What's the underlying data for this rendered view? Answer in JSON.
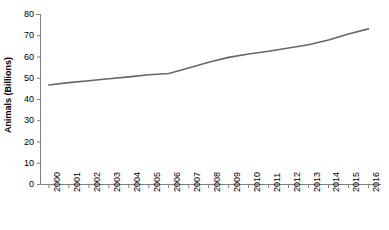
{
  "chart_data": {
    "type": "line",
    "title": "",
    "xlabel": "",
    "ylabel": "Animals (Billions)",
    "categories": [
      "2000",
      "2001",
      "2002",
      "2003",
      "2004",
      "2005",
      "2006",
      "2007",
      "2008",
      "2009",
      "2010",
      "2011",
      "2012",
      "2013",
      "2014",
      "2015",
      "2016"
    ],
    "values": [
      46.6,
      47.7,
      48.6,
      49.5,
      50.4,
      51.4,
      52.0,
      54.6,
      57.3,
      59.6,
      61.2,
      62.5,
      64.0,
      65.5,
      67.8,
      70.6,
      73.0
    ],
    "series": [
      {
        "name": "Animals (Billions)",
        "values": [
          46.6,
          47.7,
          48.6,
          49.5,
          50.4,
          51.4,
          52.0,
          54.6,
          57.3,
          59.6,
          61.2,
          62.5,
          64.0,
          65.5,
          67.8,
          70.6,
          73.0
        ]
      }
    ],
    "ylim": [
      0,
      80
    ],
    "yticks": [
      0,
      10,
      20,
      30,
      40,
      50,
      60,
      70,
      80
    ],
    "ytick_labels": [
      "0",
      "10",
      "20",
      "30",
      "40",
      "50",
      "60",
      "70",
      "80"
    ],
    "grid": false,
    "legend": "none",
    "line_color": "#666666",
    "axis_color": "#808080",
    "text_color": "#000000",
    "background_color": "#ffffff"
  }
}
